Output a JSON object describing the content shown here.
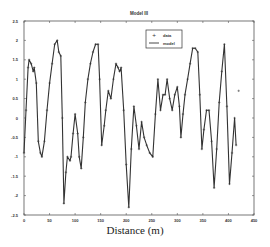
{
  "chart_data": {
    "type": "line",
    "title": "Model III",
    "xlabel": "Distance (m)",
    "ylabel": "",
    "xlim": [
      0,
      450
    ],
    "ylim": [
      -2.5,
      2.5
    ],
    "xticks": [
      0,
      50,
      100,
      150,
      200,
      250,
      300,
      350,
      400,
      450
    ],
    "yticks": [
      -2.5,
      -2,
      -1.5,
      -1,
      -0.5,
      0,
      0.5,
      1,
      1.5,
      2,
      2.5
    ],
    "xtick_labels": [
      "0",
      "50",
      "100",
      "150",
      "200",
      "250",
      "300",
      "350",
      "400",
      "450"
    ],
    "ytick_labels": [
      "-2.5",
      "-2",
      "-1.5",
      "-1",
      "-0.5",
      "0",
      "0.5",
      "1",
      "1.5",
      "2",
      "2.5"
    ],
    "grid": false,
    "legend_position": "upper center-right",
    "legend": [
      "data",
      "model"
    ],
    "series": [
      {
        "name": "data",
        "style": "markers",
        "marker": "+",
        "x": [
          0,
          4,
          8,
          10,
          14,
          18,
          20,
          24,
          28,
          32,
          35,
          40,
          45,
          50,
          55,
          60,
          65,
          68,
          72,
          75,
          78,
          82,
          85,
          90,
          92,
          96,
          100,
          105,
          108,
          112,
          116,
          120,
          125,
          130,
          135,
          140,
          145,
          148,
          152,
          157,
          160,
          165,
          170,
          175,
          180,
          184,
          187,
          190,
          195,
          200,
          205,
          210,
          215,
          220,
          225,
          230,
          235,
          240,
          246,
          252,
          257,
          262,
          267,
          272,
          276,
          280,
          285,
          290,
          295,
          300,
          304,
          307,
          311,
          315,
          320,
          325,
          330,
          335,
          340,
          344,
          348,
          352,
          357,
          362,
          367,
          372,
          377,
          382,
          387,
          392,
          397,
          402,
          407,
          412,
          415,
          420
        ],
        "y": [
          -0.9,
          0.2,
          1.3,
          1.5,
          1.4,
          1.2,
          1.3,
          0.9,
          -0.6,
          -0.9,
          -1.0,
          -0.6,
          0.2,
          0.9,
          1.4,
          1.9,
          2.0,
          1.7,
          1.6,
          0.0,
          -2.2,
          -1.4,
          -1.0,
          -1.1,
          -1.0,
          -0.4,
          0.1,
          -0.4,
          -1.0,
          -1.3,
          -0.5,
          0.4,
          1.0,
          1.4,
          1.7,
          1.9,
          1.9,
          1.0,
          -0.7,
          -0.2,
          0.2,
          0.7,
          0.5,
          1.0,
          1.4,
          1.3,
          1.2,
          1.3,
          0.2,
          -1.2,
          -2.3,
          -0.8,
          0.3,
          -0.2,
          -0.8,
          -0.1,
          -0.5,
          -0.7,
          -0.9,
          -1.0,
          0.1,
          1.0,
          0.2,
          0.6,
          0.6,
          1.0,
          0.5,
          0.2,
          0.6,
          0.8,
          0.3,
          -0.5,
          0.1,
          0.6,
          1.0,
          1.4,
          1.8,
          1.8,
          1.7,
          0.6,
          -0.8,
          -0.3,
          0.2,
          0.2,
          -0.6,
          -1.8,
          -0.8,
          0.4,
          1.2,
          1.9,
          0.3,
          -1.7,
          -0.9,
          0.0,
          -0.7,
          0.7
        ],
        "color": "#333333"
      },
      {
        "name": "model",
        "style": "line",
        "x": [
          0,
          4,
          8,
          10,
          14,
          18,
          20,
          24,
          28,
          32,
          35,
          40,
          45,
          50,
          55,
          60,
          65,
          68,
          72,
          75,
          78,
          82,
          85,
          90,
          92,
          96,
          100,
          105,
          108,
          112,
          116,
          120,
          125,
          130,
          135,
          140,
          145,
          148,
          152,
          157,
          160,
          165,
          170,
          175,
          180,
          184,
          187,
          190,
          195,
          200,
          205,
          210,
          215,
          220,
          225,
          230,
          235,
          240,
          246,
          252,
          257,
          262,
          267,
          272,
          276,
          280,
          285,
          290,
          295,
          300,
          304,
          307,
          311,
          315,
          320,
          325,
          330,
          335,
          340,
          344,
          348,
          352,
          357,
          362,
          367,
          372,
          377,
          382,
          387,
          392,
          397,
          402,
          407,
          412,
          415
        ],
        "y": [
          -0.9,
          0.2,
          1.3,
          1.5,
          1.4,
          1.2,
          1.3,
          0.9,
          -0.6,
          -0.9,
          -1.0,
          -0.6,
          0.2,
          0.9,
          1.4,
          1.9,
          2.0,
          1.7,
          1.6,
          0.0,
          -2.2,
          -1.4,
          -1.0,
          -1.1,
          -1.0,
          -0.4,
          0.1,
          -0.4,
          -1.0,
          -1.3,
          -0.5,
          0.4,
          1.0,
          1.4,
          1.7,
          1.9,
          1.9,
          1.0,
          -0.7,
          -0.2,
          0.2,
          0.7,
          0.5,
          1.0,
          1.4,
          1.3,
          1.2,
          1.3,
          0.2,
          -1.2,
          -2.3,
          -0.8,
          0.3,
          -0.2,
          -0.8,
          -0.1,
          -0.5,
          -0.7,
          -0.9,
          -1.0,
          0.1,
          1.0,
          0.2,
          0.6,
          0.6,
          1.0,
          0.5,
          0.2,
          0.6,
          0.8,
          0.3,
          -0.5,
          0.1,
          0.6,
          1.0,
          1.4,
          1.8,
          1.8,
          1.7,
          0.6,
          -0.8,
          -0.3,
          0.2,
          0.2,
          -0.6,
          -1.8,
          -0.8,
          0.4,
          1.2,
          1.9,
          0.3,
          -1.7,
          -0.9,
          0.0,
          -0.7
        ],
        "color": "#333333"
      }
    ]
  },
  "layout": {
    "plot": {
      "left": 24,
      "right": 254,
      "top": 21,
      "bottom": 215
    }
  }
}
